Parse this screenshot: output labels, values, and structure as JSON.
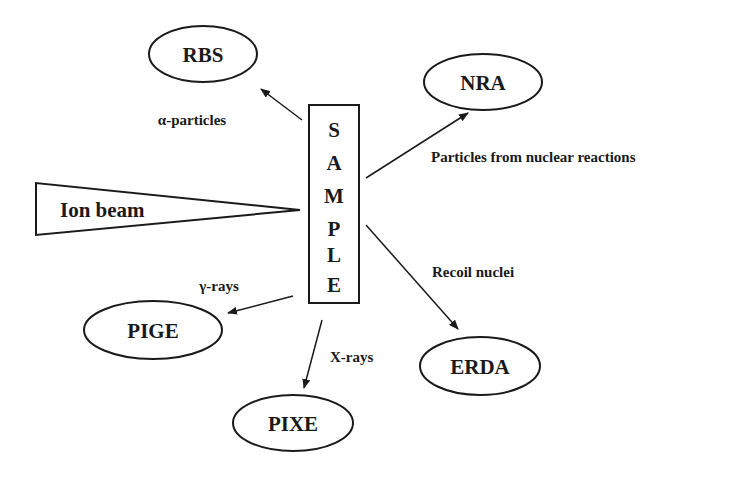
{
  "diagram": {
    "colors": {
      "stroke": "#1a1a1a",
      "background": "#ffffff"
    },
    "beam": {
      "label": "Ion beam"
    },
    "sample": {
      "letters": [
        "S",
        "A",
        "M",
        "P",
        "L",
        "E"
      ]
    },
    "techniques": [
      {
        "id": "rbs",
        "label": "RBS",
        "emission": "α-particles"
      },
      {
        "id": "nra",
        "label": "NRA",
        "emission": "Particles from nuclear reactions"
      },
      {
        "id": "erda",
        "label": "ERDA",
        "emission": "Recoil nuclei"
      },
      {
        "id": "pige",
        "label": "PIGE",
        "emission": "γ-rays"
      },
      {
        "id": "pixe",
        "label": "PIXE",
        "emission": "X-rays"
      }
    ]
  }
}
